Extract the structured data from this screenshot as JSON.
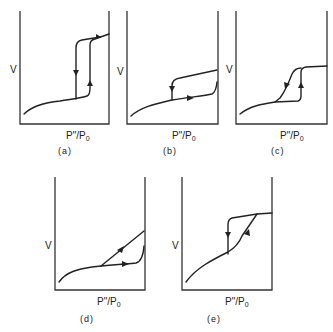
{
  "figure": {
    "panels": [
      {
        "id": "a",
        "caption": "(a)",
        "y_label": "V",
        "x_label_main": "P\"/P",
        "x_label_sub": "0",
        "description": "Stepwise isotherm with vertical hysteresis loop; adsorption branch rises vertically at higher pressure, desorption branch descends vertically at lower pressure"
      },
      {
        "id": "b",
        "caption": "(b)",
        "y_label": "V",
        "x_label_main": "P\"/P",
        "x_label_sub": "0",
        "description": "Hysteresis loop at high pressure; adsorption branch rises near saturation, desorption branch drops vertically at intermediate pressure"
      },
      {
        "id": "c",
        "caption": "(c)",
        "y_label": "V",
        "x_label_main": "P\"/P",
        "x_label_sub": "0",
        "description": "Loop with steep adsorption rise (vertical) and sloped desorption branch reaching plateau"
      },
      {
        "id": "d",
        "caption": "(d)",
        "y_label": "V",
        "x_label_main": "P\"/P",
        "x_label_sub": "0",
        "description": "Desorption branch slopes linearly from saturation down to adsorption branch; adsorption branch nearly flat then rising at saturation"
      },
      {
        "id": "e",
        "caption": "(e)",
        "y_label": "V",
        "x_label_main": "P\"/P",
        "x_label_sub": "0",
        "description": "Adsorption branch sloped rising to plateau; desorption branch drops vertically"
      }
    ]
  }
}
